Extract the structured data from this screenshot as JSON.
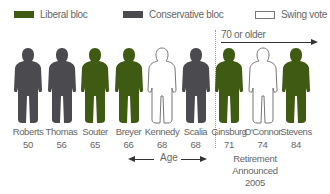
{
  "colors": {
    "liberal": "#3f5a12",
    "conservative": "#4a4a4f",
    "swing": "#ffffff",
    "swing_stroke": "#777777"
  },
  "legend": [
    {
      "label": "Liberal bloc",
      "type": "liberal"
    },
    {
      "label": "Conservative bloc",
      "type": "conservative"
    },
    {
      "label": "Swing vote",
      "type": "swing"
    }
  ],
  "older_section": {
    "label": "70 or older"
  },
  "age_axis": {
    "label": "Age"
  },
  "justices": [
    {
      "name": "Roberts",
      "age": "50",
      "bloc": "conservative"
    },
    {
      "name": "Thomas",
      "age": "56",
      "bloc": "conservative"
    },
    {
      "name": "Souter",
      "age": "65",
      "bloc": "liberal"
    },
    {
      "name": "Breyer",
      "age": "66",
      "bloc": "liberal"
    },
    {
      "name": "Kennedy",
      "age": "68",
      "bloc": "swing"
    },
    {
      "name": "Scalia",
      "age": "68",
      "bloc": "conservative"
    },
    {
      "name": "Ginsburg",
      "age": "71",
      "bloc": "liberal"
    },
    {
      "name": "O'Connor",
      "age": "74",
      "bloc": "swing"
    },
    {
      "name": "Stevens",
      "age": "84",
      "bloc": "liberal"
    }
  ],
  "annotation": {
    "line1": "Retirement",
    "line2": "Announced",
    "line3": "2005"
  }
}
